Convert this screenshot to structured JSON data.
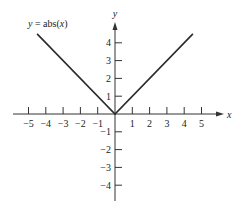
{
  "chart_data": {
    "type": "line",
    "title": "y = abs(x)",
    "title_parts": {
      "y": "y",
      "eq": " = abs(",
      "x": "x",
      "close": ")"
    },
    "xlabel": "x",
    "ylabel": "y",
    "xlim": [
      -5.5,
      5.8
    ],
    "ylim": [
      -4.8,
      5
    ],
    "grid": false,
    "x_ticks": [
      -5,
      -4,
      -3,
      -2,
      -1,
      1,
      2,
      3,
      4,
      5
    ],
    "x_tick_labels": [
      "−5",
      "−4",
      "−3",
      "−2",
      "−1",
      "1",
      "2",
      "3",
      "4",
      "5"
    ],
    "y_ticks": [
      4,
      3,
      2,
      1,
      -1,
      -2,
      -3,
      -4
    ],
    "y_tick_labels": [
      "4",
      "3",
      "2",
      "1",
      "−1",
      "−2",
      "−3",
      "−4"
    ],
    "series": [
      {
        "name": "y = abs(x)",
        "x": [
          -4.5,
          0,
          4.5
        ],
        "y": [
          4.5,
          0,
          4.5
        ]
      }
    ]
  },
  "colors": {
    "axis": "#333333",
    "line": "#2b2b2b",
    "text": "#222222"
  }
}
